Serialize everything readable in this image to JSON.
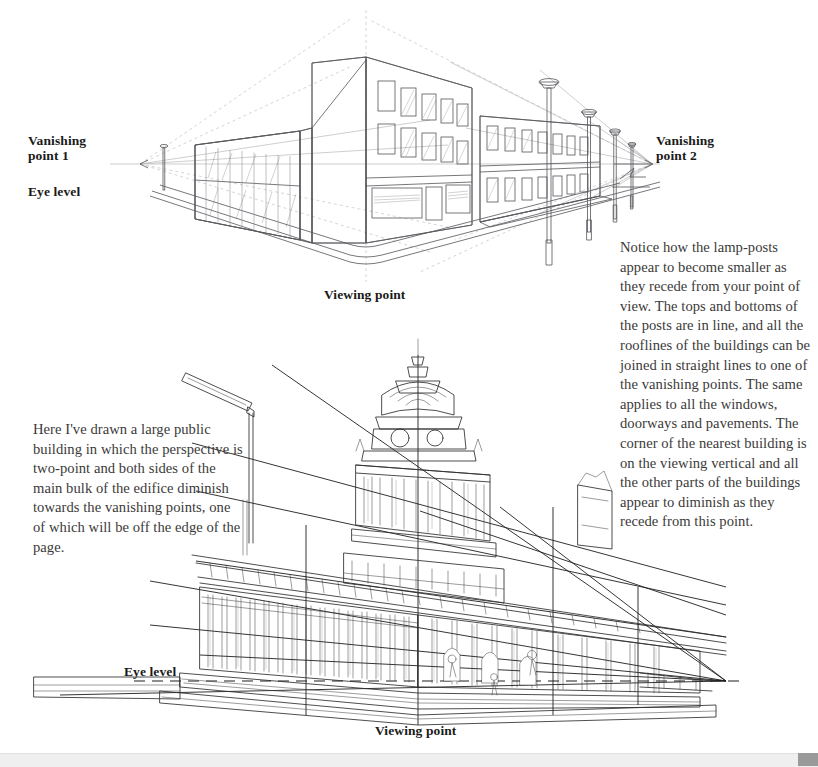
{
  "page": {
    "background_color": "#ffffff",
    "text_color": "#231f20"
  },
  "figures": {
    "top": {
      "name": "two-point perspective office block with lamp-posts",
      "labels": {
        "vanishing_point_1": "Vanishing\npoint 1",
        "eye_level": "Eye level",
        "vanishing_point_2": "Vanishing\npoint 2",
        "viewing_point": "Viewing point"
      },
      "vanishing_point_1_xy": [
        140,
        164
      ],
      "vanishing_point_2_xy": [
        652,
        164
      ],
      "eye_level_y": 164,
      "viewing_point_x": 366,
      "lamp_post_count": 4
    },
    "bottom": {
      "name": "Leeds Town Hall style public building in two-point perspective",
      "labels": {
        "eye_level": "Eye level",
        "viewing_point": "Viewing point"
      },
      "eye_level_y": 681,
      "viewing_point_x": 418,
      "vanishing_point_right_xy": [
        726,
        681
      ]
    }
  },
  "notes": {
    "right": "Notice how the lamp-posts appear to become smaller as they recede from your point of view. The tops and bottoms of the posts are in line, and all the rooflines of the buildings can be joined in straight lines to one of the vanishing points. The same applies to all the windows, doorways and pavements. The corner of the nearest building is on the viewing vertical and all the other parts of the buildings appear to diminish as they recede from this point.",
    "left": "Here I've drawn a large public building in which the perspective is two-point and both sides of the main bulk of the edifice diminish towards the vanishing points, one of which will be off the edge of the page."
  },
  "scrollbar": {
    "orientation": "horizontal",
    "track_color": "#efefef",
    "thumb_color": "#9a9a9a",
    "thumb_position_px": 798
  }
}
